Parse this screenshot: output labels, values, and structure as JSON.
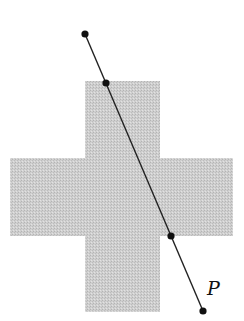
{
  "diagram": {
    "shape": {
      "type": "cross",
      "fill_color": "#c8c8c8",
      "pattern": "stippled"
    },
    "line": {
      "color": "#222222",
      "points_marked": 4,
      "intersections_with_shape": 2
    },
    "point_color": "#111111",
    "labels": {
      "point_label": "P"
    }
  }
}
